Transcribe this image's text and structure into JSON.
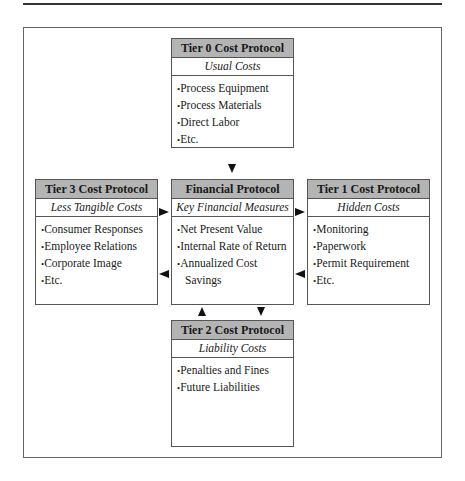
{
  "diagram": {
    "boxes": {
      "tier0": {
        "title": "Tier 0 Cost Protocol",
        "subtitle": "Usual Costs",
        "items": [
          "Process Equipment",
          "Process Materials",
          "Direct Labor",
          "Etc."
        ]
      },
      "tier3": {
        "title": "Tier 3 Cost Protocol",
        "subtitle": "Less Tangible Costs",
        "items": [
          "Consumer Responses",
          "Employee Relations",
          "Corporate Image",
          "Etc."
        ]
      },
      "financial": {
        "title": "Financial Protocol",
        "subtitle": "Key Financial Measures",
        "items": [
          "Net Present Value",
          "Internal Rate of Return",
          "Annualized Cost Savings"
        ]
      },
      "tier1": {
        "title": "Tier 1 Cost Protocol",
        "subtitle": "Hidden Costs",
        "items": [
          "Monitoring",
          "Paperwork",
          "Permit Requirement",
          "Etc."
        ]
      },
      "tier2": {
        "title": "Tier 2 Cost Protocol",
        "subtitle": "Liability Costs",
        "items": [
          "Penalties and Fines",
          "Future Liabilities"
        ]
      }
    },
    "arrows": [
      {
        "from": "tier0",
        "to": "financial",
        "direction": "down"
      },
      {
        "from": "tier3",
        "to": "financial",
        "direction": "right"
      },
      {
        "from": "financial",
        "to": "tier3",
        "direction": "left"
      },
      {
        "from": "financial",
        "to": "tier1",
        "direction": "right"
      },
      {
        "from": "tier1",
        "to": "financial",
        "direction": "left"
      },
      {
        "from": "tier2",
        "to": "financial",
        "direction": "up"
      },
      {
        "from": "financial",
        "to": "tier2",
        "direction": "down"
      }
    ],
    "colors": {
      "header_fill": "#b4b4b4",
      "border": "#555555",
      "arrow": "#111111"
    }
  }
}
